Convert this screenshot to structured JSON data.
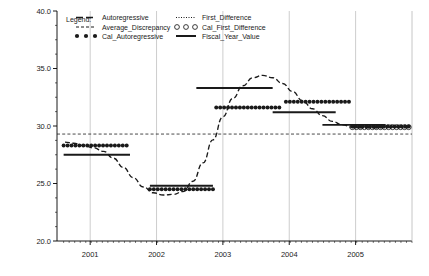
{
  "chart_data": {
    "type": "line",
    "title": "",
    "xlabel": "",
    "ylabel": "",
    "xlim": [
      2000.5,
      2005.85
    ],
    "ylim": [
      20.0,
      40.0
    ],
    "grid": true,
    "y_ticks": [
      "20.0",
      "25.0",
      "30.0",
      "35.0",
      "40.0"
    ],
    "y_tick_values": [
      20.0,
      25.0,
      30.0,
      35.0,
      40.0
    ],
    "y_minor_interval": 1.25,
    "x_ticks": [
      "2001",
      "2002",
      "2003",
      "2004",
      "2005"
    ],
    "x_tick_values": [
      2001,
      2002,
      2003,
      2004,
      2005
    ],
    "legend_title": "Legend:",
    "legend_position": "top-left inside plot",
    "series": [
      {
        "name": "Autoregressive",
        "style": "dashed-line",
        "x": [
          2000.62,
          2000.75,
          2000.9,
          2001.05,
          2001.2,
          2001.35,
          2001.5,
          2001.65,
          2001.8,
          2001.95,
          2002.1,
          2002.25,
          2002.4,
          2002.55,
          2002.7,
          2002.85,
          2003.0,
          2003.15,
          2003.3,
          2003.45,
          2003.6,
          2003.75,
          2003.9,
          2004.05,
          2004.2,
          2004.35,
          2004.5,
          2004.65,
          2004.8,
          2004.95,
          2005.1,
          2005.3,
          2005.5,
          2005.7
        ],
        "y": [
          28.6,
          28.5,
          28.3,
          28.1,
          27.8,
          27.2,
          26.4,
          25.5,
          24.7,
          24.2,
          24.0,
          24.05,
          24.3,
          25.2,
          26.8,
          28.8,
          30.8,
          32.4,
          33.5,
          34.2,
          34.4,
          34.2,
          33.7,
          33.0,
          32.2,
          31.5,
          30.9,
          30.4,
          30.1,
          29.9,
          29.85,
          29.85,
          29.9,
          29.95
        ]
      },
      {
        "name": "Average_Discrepancy",
        "style": "long-dashed-horizontal",
        "value": 29.3
      },
      {
        "name": "Cal_Autoregressive",
        "style": "filled-dots",
        "segments": [
          {
            "x_start": 2000.6,
            "x_end": 2001.55,
            "y": 28.3
          },
          {
            "x_start": 2001.9,
            "x_end": 2002.85,
            "y": 24.5
          },
          {
            "x_start": 2002.9,
            "x_end": 2003.85,
            "y": 31.6
          },
          {
            "x_start": 2003.95,
            "x_end": 2004.9,
            "y": 32.1
          },
          {
            "x_start": 2004.95,
            "x_end": 2005.8,
            "y": 29.95
          }
        ]
      },
      {
        "name": "First_Difference",
        "style": "dotted-line",
        "segments": [
          {
            "x_start": 2004.95,
            "x_end": 2005.8,
            "y": 29.85
          }
        ]
      },
      {
        "name": "Cal_First_Difference",
        "style": "open-circles",
        "segments": [
          {
            "x_start": 2004.95,
            "x_end": 2005.8,
            "y": 29.9
          }
        ]
      },
      {
        "name": "Fiscal_Year_Value",
        "style": "solid-horizontal-segments",
        "segments": [
          {
            "x_start": 2000.6,
            "x_end": 2001.6,
            "y": 27.5
          },
          {
            "x_start": 2001.9,
            "x_end": 2002.85,
            "y": 24.8
          },
          {
            "x_start": 2002.6,
            "x_end": 2003.75,
            "y": 33.3
          },
          {
            "x_start": 2003.75,
            "x_end": 2004.7,
            "y": 31.2
          },
          {
            "x_start": 2004.5,
            "x_end": 2005.45,
            "y": 30.1
          }
        ]
      }
    ]
  },
  "legend": {
    "title": "Legend:",
    "items_left": [
      {
        "label": "Autoregressive",
        "marker": "dashed-line"
      },
      {
        "label": "Average_Discrepancy",
        "marker": "short-dashed-line"
      },
      {
        "label": "Cal_Autoregressive",
        "marker": "filled-dots"
      }
    ],
    "items_right": [
      {
        "label": "First_Difference",
        "marker": "dotted-line"
      },
      {
        "label": "Cal_First_Difference",
        "marker": "open-circles"
      },
      {
        "label": "Fiscal_Year_Value",
        "marker": "solid-line"
      }
    ]
  },
  "colors": {
    "axis": "#000000",
    "grid": "#b8b8b8",
    "series": "#1a1a1a",
    "background": "#ffffff"
  }
}
